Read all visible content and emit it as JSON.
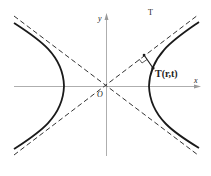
{
  "diagram": {
    "type": "hyperbola-with-asymptotes",
    "axis_labels": {
      "x": "x",
      "y": "y",
      "origin": "O"
    },
    "point_label": "T(r,t)",
    "faint_mark": "T",
    "colors": {
      "curve": "#1a1a1a",
      "axis": "#888888",
      "asymptote": "#333333",
      "background": "#ffffff"
    }
  }
}
